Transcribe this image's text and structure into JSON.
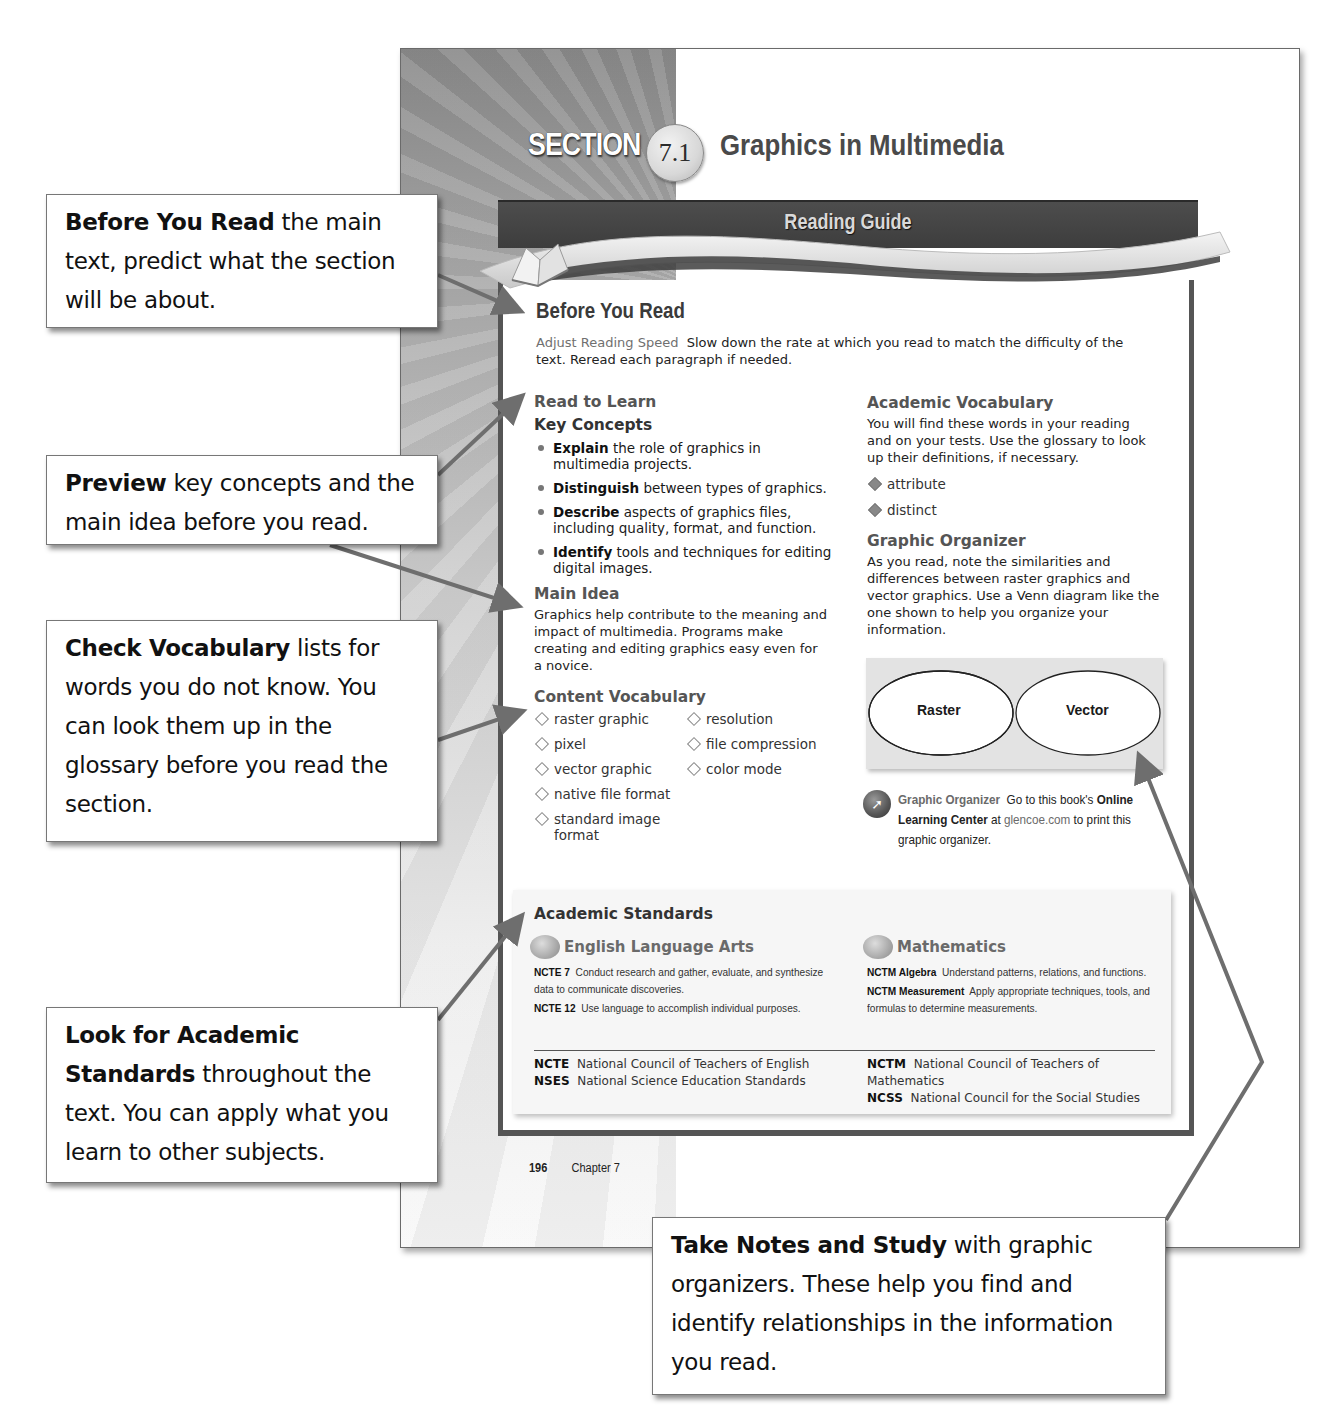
{
  "page": {
    "section_label": "SECTION",
    "section_number": "7.1",
    "section_title": "Graphics in Multimedia",
    "folio_page": "196",
    "folio_chapter": "Chapter 7"
  },
  "reading_guide": {
    "banner_title": "Reading Guide",
    "before_you_read": {
      "heading": "Before You Read",
      "lead": "Adjust Reading Speed",
      "text": "Slow down the rate at which you read to match the difficulty of the text. Reread each paragraph if needed."
    },
    "read_to_learn": {
      "heading": "Read to Learn",
      "key_concepts_heading": "Key Concepts",
      "key_concepts": [
        {
          "verb": "Explain",
          "text": "the role of graphics in multimedia projects."
        },
        {
          "verb": "Distinguish",
          "text": "between types of graphics."
        },
        {
          "verb": "Describe",
          "text": "aspects of graphics files, including quality, format, and function."
        },
        {
          "verb": "Identify",
          "text": "tools and techniques for editing digital images."
        }
      ]
    },
    "main_idea": {
      "heading": "Main Idea",
      "text": "Graphics help contribute to the meaning and impact of multimedia. Programs make creating and editing graphics easy even for a novice."
    },
    "content_vocabulary": {
      "heading": "Content Vocabulary",
      "terms": [
        "raster graphic",
        "resolution",
        "pixel",
        "file compression",
        "vector graphic",
        "color mode",
        "native file format",
        "",
        "standard image format",
        ""
      ]
    },
    "academic_vocabulary": {
      "heading": "Academic Vocabulary",
      "text": "You will find these words in your reading and on your tests. Use the glossary to look up their definitions, if necessary.",
      "terms": [
        "attribute",
        "distinct"
      ]
    },
    "graphic_organizer": {
      "heading": "Graphic Organizer",
      "text": "As you read, note the similarities and differences between raster graphics and vector graphics. Use a Venn diagram like the one shown to help you organize your information.",
      "venn_left": "Raster",
      "venn_right": "Vector",
      "note_label": "Graphic Organizer",
      "note_text_1": "Go to this book's",
      "note_bold": "Online Learning Center",
      "note_text_2": "at",
      "note_link": "glencoe.com",
      "note_text_3": "to print this graphic organizer."
    },
    "academic_standards": {
      "heading": "Academic Standards",
      "ela": {
        "heading": "English Language Arts",
        "items": [
          {
            "code": "NCTE 7",
            "text": "Conduct research and gather, evaluate, and synthesize data to communicate discoveries."
          },
          {
            "code": "NCTE 12",
            "text": "Use language to accomplish individual purposes."
          }
        ]
      },
      "math": {
        "heading": "Mathematics",
        "items": [
          {
            "code": "NCTM Algebra",
            "text": "Understand patterns, relations, and functions."
          },
          {
            "code": "NCTM Measurement",
            "text": "Apply appropriate techniques, tools, and formulas to determine measurements."
          }
        ]
      },
      "abbreviations": [
        {
          "code": "NCTE",
          "text": "National Council of Teachers of English"
        },
        {
          "code": "NSES",
          "text": "National Science Education Standards"
        },
        {
          "code": "NCTM",
          "text": "National Council of Teachers of Mathematics"
        },
        {
          "code": "NCSS",
          "text": "National Council for the Social Studies"
        }
      ]
    }
  },
  "callouts": [
    {
      "bold": "Before You Read",
      "text": " the main text, predict what the section will be about."
    },
    {
      "bold": "Preview",
      "text": " key concepts and the main idea before you read."
    },
    {
      "bold": "Check Vocabulary",
      "text": " lists for words you do not know. You can look them up in the glossary before you read the section."
    },
    {
      "bold": "Look for Academic Standards",
      "text": " throughout the text. You can apply what you learn to other subjects."
    },
    {
      "bold": "Take Notes and Study",
      "text": " with graphic organizers. These help you find and identify relationships in the information you read."
    }
  ],
  "colors": {
    "banner": "#454545",
    "frame": "#555555",
    "arrow": "#6e6e6e",
    "callout_border": "#777777"
  }
}
